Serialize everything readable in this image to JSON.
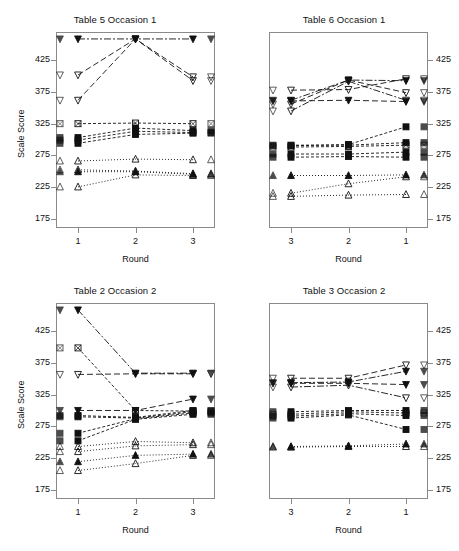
{
  "figure": {
    "width": 459,
    "height": 551,
    "background": "#ffffff",
    "axis_color": "#8a8a8a",
    "text_color": "#111111"
  },
  "chart_data": [
    {
      "type": "line",
      "title": "Table 5 Occasion 1",
      "xlabel": "Round",
      "ylabel": "Scale Score",
      "categories": [
        "1",
        "2",
        "3"
      ],
      "x_reversed": false,
      "yticks": [
        175,
        225,
        275,
        325,
        375,
        425
      ],
      "ylim": [
        160,
        470
      ],
      "grid": false,
      "legend": "none",
      "y_axis_side": "left",
      "series": [
        {
          "name": "A1",
          "marker": "down-triangle-filled",
          "linestyle": "dashdot",
          "values": [
            459,
            459,
            459
          ]
        },
        {
          "name": "A2",
          "marker": "down-triangle-open",
          "linestyle": "longdash",
          "values": [
            402,
            459,
            399
          ]
        },
        {
          "name": "A3",
          "marker": "down-triangle-open",
          "linestyle": "longdash",
          "values": [
            362,
            459,
            393
          ]
        },
        {
          "name": "B1",
          "marker": "square-open",
          "linestyle": "dashed",
          "values": [
            325,
            326,
            325
          ]
        },
        {
          "name": "B2",
          "marker": "square-filled",
          "linestyle": "dashed",
          "values": [
            303,
            318,
            314
          ]
        },
        {
          "name": "B3",
          "marker": "square-filled",
          "linestyle": "dashed",
          "values": [
            299,
            313,
            311
          ]
        },
        {
          "name": "B4",
          "marker": "square-filled",
          "linestyle": "dashed",
          "values": [
            294,
            308,
            310
          ]
        },
        {
          "name": "C1",
          "marker": "up-triangle-open",
          "linestyle": "dotted",
          "values": [
            266,
            269,
            268
          ]
        },
        {
          "name": "C2",
          "marker": "up-triangle-open",
          "linestyle": "dotted",
          "values": [
            252,
            250,
            246
          ]
        },
        {
          "name": "C3",
          "marker": "up-triangle-filled",
          "linestyle": "dotted",
          "values": [
            249,
            249,
            245
          ]
        },
        {
          "name": "C4",
          "marker": "up-triangle-open",
          "linestyle": "dotted",
          "values": [
            225,
            244,
            243
          ]
        }
      ]
    },
    {
      "type": "line",
      "title": "Table 6 Occasion 1",
      "xlabel": "Round",
      "ylabel": "",
      "categories": [
        "3",
        "2",
        "1"
      ],
      "x_reversed": true,
      "yticks": [
        175,
        225,
        275,
        325,
        375,
        425
      ],
      "ylim": [
        160,
        470
      ],
      "grid": false,
      "legend": "none",
      "y_axis_side": "right",
      "series": [
        {
          "name": "A1",
          "marker": "down-triangle-open",
          "linestyle": "longdash",
          "values": [
            378,
            379,
            396
          ]
        },
        {
          "name": "A2",
          "marker": "down-triangle-filled",
          "linestyle": "dashdot",
          "values": [
            362,
            394,
            393
          ]
        },
        {
          "name": "A3",
          "marker": "down-triangle-open",
          "linestyle": "longdash",
          "values": [
            356,
            394,
            374
          ]
        },
        {
          "name": "A4",
          "marker": "down-triangle-open",
          "linestyle": "dashdot",
          "values": [
            345,
            392,
            362
          ]
        },
        {
          "name": "A5",
          "marker": "down-triangle-filled",
          "linestyle": "longdash",
          "values": [
            361,
            362,
            360
          ]
        },
        {
          "name": "B1",
          "marker": "square-filled",
          "linestyle": "dashed",
          "values": [
            290,
            292,
            320
          ]
        },
        {
          "name": "B2",
          "marker": "square-filled",
          "linestyle": "dashed",
          "values": [
            291,
            291,
            295
          ]
        },
        {
          "name": "B3",
          "marker": "square-open",
          "linestyle": "dashed",
          "values": [
            288,
            289,
            291
          ]
        },
        {
          "name": "B4",
          "marker": "square-filled",
          "linestyle": "dashed",
          "values": [
            277,
            277,
            280
          ]
        },
        {
          "name": "B5",
          "marker": "square-filled",
          "linestyle": "dashed",
          "values": [
            272,
            273,
            272
          ]
        },
        {
          "name": "C1",
          "marker": "up-triangle-filled",
          "linestyle": "dotted",
          "values": [
            243,
            243,
            244
          ]
        },
        {
          "name": "C2",
          "marker": "up-triangle-open",
          "linestyle": "dotted",
          "values": [
            215,
            230,
            241
          ]
        },
        {
          "name": "C3",
          "marker": "up-triangle-open",
          "linestyle": "dotted",
          "values": [
            210,
            212,
            213
          ]
        }
      ]
    },
    {
      "type": "line",
      "title": "Table 2 Occasion 2",
      "xlabel": "Round",
      "ylabel": "Scale Score",
      "categories": [
        "1",
        "2",
        "3"
      ],
      "x_reversed": false,
      "yticks": [
        175,
        225,
        275,
        325,
        375,
        425
      ],
      "ylim": [
        160,
        470
      ],
      "grid": false,
      "legend": "none",
      "y_axis_side": "left",
      "series": [
        {
          "name": "A1",
          "marker": "down-triangle-filled",
          "linestyle": "dashdot",
          "values": [
            459,
            359,
            359
          ]
        },
        {
          "name": "A2",
          "marker": "down-triangle-open",
          "linestyle": "longdash",
          "values": [
            357,
            358,
            358
          ]
        },
        {
          "name": "B1",
          "marker": "square-open",
          "linestyle": "dashed",
          "values": [
            399,
            300,
            299
          ]
        },
        {
          "name": "B2",
          "marker": "down-triangle-filled",
          "linestyle": "longdash",
          "values": [
            300,
            300,
            318
          ]
        },
        {
          "name": "B3",
          "marker": "square-filled",
          "linestyle": "dashed",
          "values": [
            292,
            289,
            300
          ]
        },
        {
          "name": "B4",
          "marker": "square-filled",
          "linestyle": "dashed",
          "values": [
            290,
            288,
            298
          ]
        },
        {
          "name": "B5",
          "marker": "square-filled",
          "linestyle": "dashed",
          "values": [
            264,
            287,
            296
          ]
        },
        {
          "name": "B6",
          "marker": "square-filled",
          "linestyle": "dashed",
          "values": [
            252,
            286,
            294
          ]
        },
        {
          "name": "C1",
          "marker": "up-triangle-open",
          "linestyle": "dotted",
          "values": [
            243,
            251,
            249
          ]
        },
        {
          "name": "C2",
          "marker": "up-triangle-open",
          "linestyle": "dotted",
          "values": [
            235,
            244,
            246
          ]
        },
        {
          "name": "C3",
          "marker": "up-triangle-filled",
          "linestyle": "dotted",
          "values": [
            219,
            229,
            231
          ]
        },
        {
          "name": "C4",
          "marker": "up-triangle-open",
          "linestyle": "dotted",
          "values": [
            205,
            216,
            229
          ]
        }
      ]
    },
    {
      "type": "line",
      "title": "Table 3 Occasion 2",
      "xlabel": "Round",
      "ylabel": "",
      "categories": [
        "3",
        "2",
        "1"
      ],
      "x_reversed": true,
      "yticks": [
        175,
        225,
        275,
        325,
        375,
        425
      ],
      "ylim": [
        160,
        470
      ],
      "grid": false,
      "legend": "none",
      "y_axis_side": "right",
      "series": [
        {
          "name": "A1",
          "marker": "down-triangle-open",
          "linestyle": "longdash",
          "values": [
            351,
            351,
            372
          ]
        },
        {
          "name": "A2",
          "marker": "down-triangle-filled",
          "linestyle": "dashdot",
          "values": [
            344,
            345,
            362
          ]
        },
        {
          "name": "A3",
          "marker": "down-triangle-filled",
          "linestyle": "longdash",
          "values": [
            343,
            343,
            341
          ]
        },
        {
          "name": "A4",
          "marker": "down-triangle-open",
          "linestyle": "dashdot",
          "values": [
            337,
            340,
            320
          ]
        },
        {
          "name": "B1",
          "marker": "square-filled",
          "linestyle": "dashed",
          "values": [
            298,
            300,
            300
          ]
        },
        {
          "name": "B2",
          "marker": "square-open",
          "linestyle": "dashed",
          "values": [
            294,
            298,
            296
          ]
        },
        {
          "name": "B3",
          "marker": "square-filled",
          "linestyle": "dashed",
          "values": [
            291,
            295,
            292
          ]
        },
        {
          "name": "B4",
          "marker": "square-filled",
          "linestyle": "dashed",
          "values": [
            288,
            293,
            270
          ]
        },
        {
          "name": "C1",
          "marker": "up-triangle-filled",
          "linestyle": "dotted",
          "values": [
            243,
            244,
            247
          ]
        },
        {
          "name": "C2",
          "marker": "up-triangle-open",
          "linestyle": "dotted",
          "values": [
            242,
            243,
            243
          ]
        }
      ]
    }
  ],
  "panels": [
    {
      "id": "panel-table5-occasion1",
      "title": "Table 5 Occasion 1",
      "xlabel": "Round",
      "ylabel": "Scale Score",
      "xticklabels": [
        "1",
        "2",
        "3"
      ],
      "yticklabels": [
        "425",
        "375",
        "325",
        "275",
        "225",
        "175"
      ]
    },
    {
      "id": "panel-table6-occasion1",
      "title": "Table 6 Occasion 1",
      "xlabel": "Round",
      "ylabel": "",
      "xticklabels": [
        "3",
        "2",
        "1"
      ],
      "yticklabels": [
        "425",
        "375",
        "325",
        "275",
        "225",
        "175"
      ]
    },
    {
      "id": "panel-table2-occasion2",
      "title": "Table 2 Occasion 2",
      "xlabel": "Round",
      "ylabel": "Scale Score",
      "xticklabels": [
        "1",
        "2",
        "3"
      ],
      "yticklabels": [
        "425",
        "375",
        "325",
        "275",
        "225",
        "175"
      ]
    },
    {
      "id": "panel-table3-occasion2",
      "title": "Table 3 Occasion 2",
      "xlabel": "Round",
      "ylabel": "",
      "xticklabels": [
        "3",
        "2",
        "1"
      ],
      "yticklabels": [
        "425",
        "375",
        "325",
        "275",
        "225",
        "175"
      ]
    }
  ]
}
